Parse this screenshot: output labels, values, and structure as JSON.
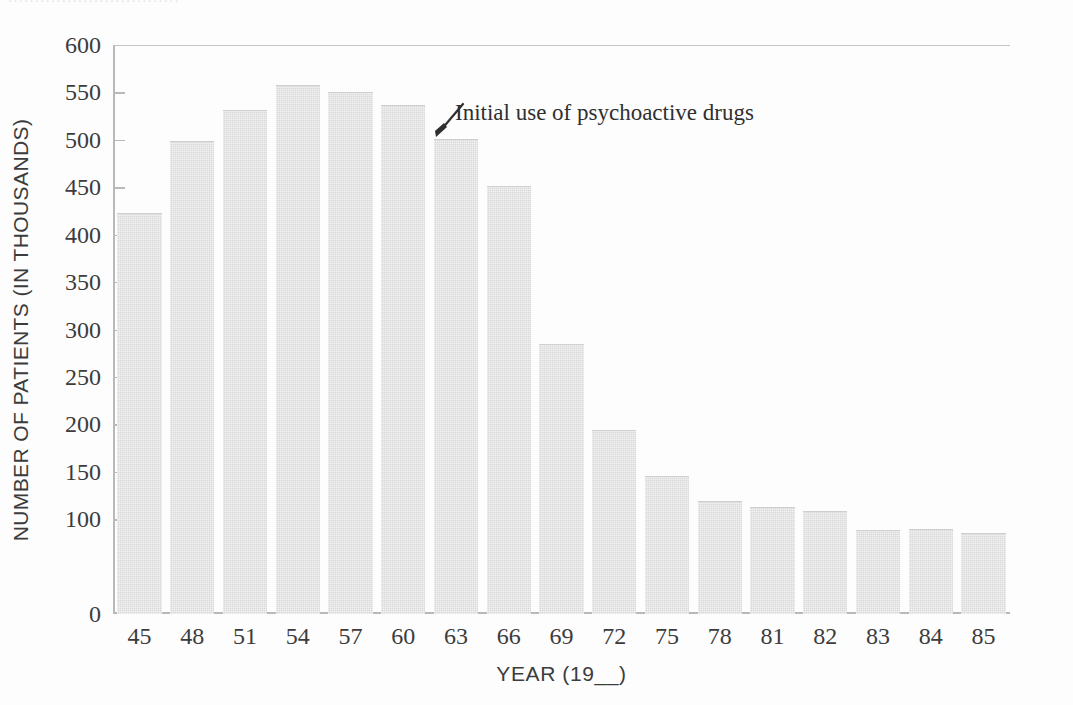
{
  "page": {
    "top_partial_text": "................................"
  },
  "chart_data": {
    "type": "bar",
    "title": "",
    "subtitle": "",
    "xlabel": "YEAR (19__)",
    "ylabel": "NUMBER OF PATIENTS (IN THOUSANDS)",
    "categories": [
      "45",
      "48",
      "51",
      "54",
      "57",
      "60",
      "63",
      "66",
      "69",
      "72",
      "75",
      "78",
      "81",
      "82",
      "83",
      "84",
      "85"
    ],
    "values": [
      422,
      498,
      530,
      557,
      549,
      536,
      500,
      450,
      284,
      193,
      144,
      118,
      112,
      108,
      88,
      89,
      84
    ],
    "ylim": [
      0,
      600
    ],
    "yticks": [
      0,
      100,
      150,
      200,
      250,
      300,
      350,
      400,
      450,
      500,
      550,
      600
    ],
    "ytick_labels": [
      "0",
      "100",
      "150",
      "200",
      "250",
      "300",
      "350",
      "400",
      "450",
      "500",
      "550",
      "600"
    ],
    "grid": false,
    "legend": "none",
    "bar_color": "#d9d9d9",
    "axis_color": "#b9b9b9",
    "text_color": "#3c3c3c",
    "annotations": [
      {
        "text": "Initial use of psychoactive drugs",
        "points_to_category": "54",
        "arrow": "diagonal-down-left"
      }
    ]
  }
}
